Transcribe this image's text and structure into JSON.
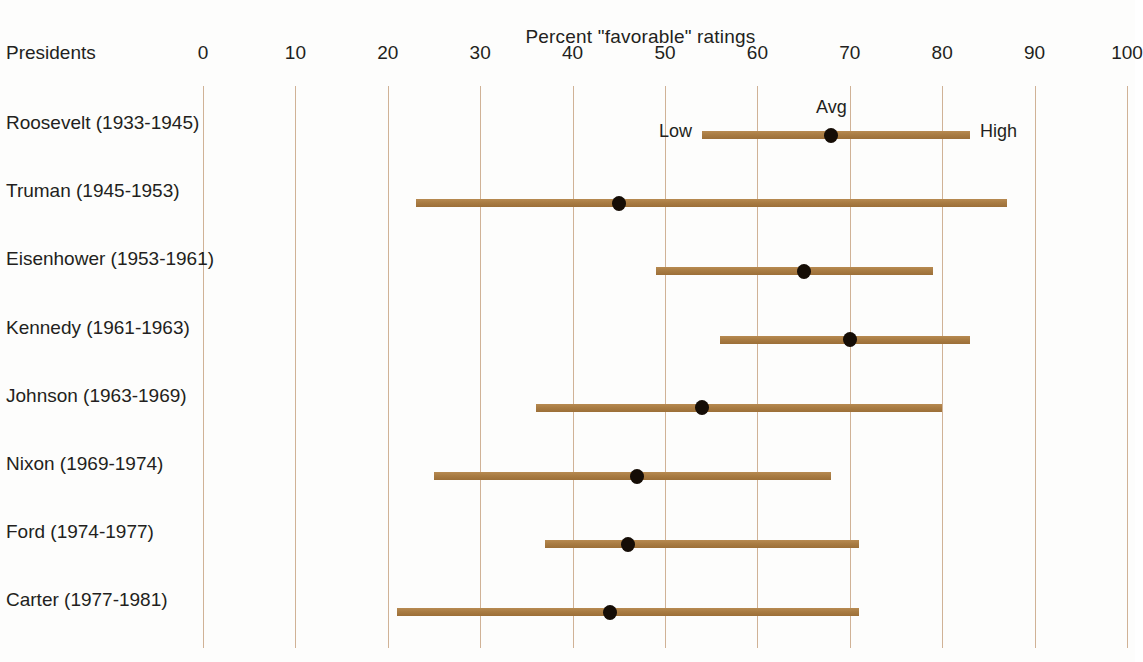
{
  "title": "Percent \"favorable\" ratings",
  "axis": {
    "corner_label": "Presidents",
    "tick_labels": [
      "0",
      "10",
      "20",
      "30",
      "40",
      "50",
      "60",
      "70",
      "80",
      "90",
      "100"
    ]
  },
  "annotations": {
    "low": "Low",
    "avg": "Avg",
    "high": "High"
  },
  "colors": {
    "bar": "#a97c43",
    "dot": "#150d06",
    "grid": "#c8a484",
    "text": "#231f20",
    "background": "#fdfdfc"
  },
  "rows": [
    {
      "label": "Roosevelt (1933-1945)",
      "low": 54,
      "avg": 68,
      "high": 83
    },
    {
      "label": "Truman (1945-1953)",
      "low": 23,
      "avg": 45,
      "high": 87
    },
    {
      "label": "Eisenhower (1953-1961)",
      "low": 49,
      "avg": 65,
      "high": 79
    },
    {
      "label": "Kennedy (1961-1963)",
      "low": 56,
      "avg": 70,
      "high": 83
    },
    {
      "label": "Johnson (1963-1969)",
      "low": 36,
      "avg": 54,
      "high": 80
    },
    {
      "label": "Nixon (1969-1974)",
      "low": 25,
      "avg": 47,
      "high": 68
    },
    {
      "label": "Ford (1974-1977)",
      "low": 37,
      "avg": 46,
      "high": 71
    },
    {
      "label": "Carter (1977-1981)",
      "low": 21,
      "avg": 44,
      "high": 71
    }
  ],
  "chart_data": {
    "type": "bar",
    "title": "Percent \"favorable\" ratings",
    "subtitle": "",
    "xlabel": "Percent \"favorable\" ratings",
    "ylabel": "Presidents",
    "xlim": [
      0,
      100
    ],
    "xticks": [
      0,
      10,
      20,
      30,
      40,
      50,
      60,
      70,
      80,
      90,
      100
    ],
    "grid": "vertical",
    "legend": "inline-annotations",
    "categories": [
      "Roosevelt (1933-1945)",
      "Truman (1945-1953)",
      "Eisenhower (1953-1961)",
      "Kennedy (1961-1963)",
      "Johnson (1963-1969)",
      "Nixon (1969-1974)",
      "Ford (1974-1977)",
      "Carter (1977-1981)"
    ],
    "series": [
      {
        "name": "Low",
        "values": [
          54,
          23,
          49,
          56,
          36,
          25,
          37,
          21
        ]
      },
      {
        "name": "Avg",
        "values": [
          68,
          45,
          65,
          70,
          54,
          47,
          46,
          44
        ]
      },
      {
        "name": "High",
        "values": [
          83,
          87,
          79,
          83,
          80,
          68,
          71,
          71
        ]
      }
    ],
    "annotations": [
      "Low",
      "Avg",
      "High"
    ]
  }
}
